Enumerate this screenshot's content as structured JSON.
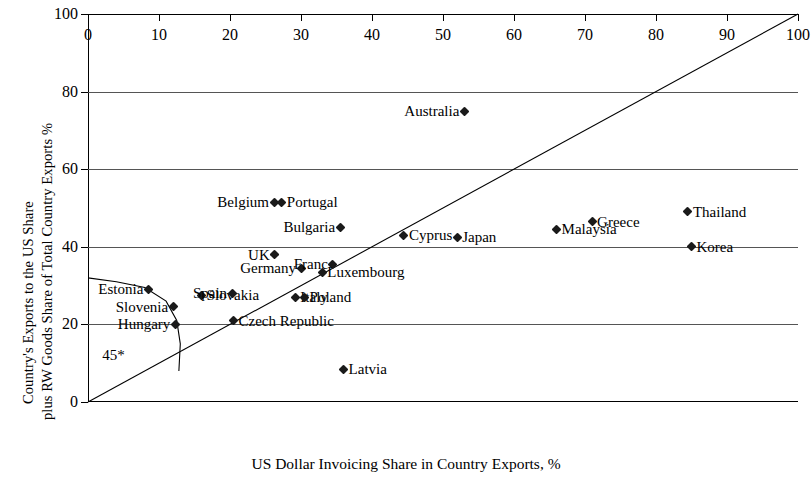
{
  "chart_data": {
    "type": "scatter",
    "title": "",
    "xlabel": "US Dollar Invoicing Share in Country Exports, %",
    "ylabel_line1": "Country's Exports to the US Share",
    "ylabel_line2": "plus RW Goods Share of Total Country Exports %",
    "xlim": [
      0,
      100
    ],
    "ylim": [
      0,
      100
    ],
    "xticks": [
      0,
      10,
      20,
      30,
      40,
      50,
      60,
      70,
      80,
      90,
      100
    ],
    "yticks": [
      0,
      20,
      40,
      60,
      80,
      100
    ],
    "grid": "horizontal",
    "legend": "none",
    "annotations": [
      {
        "text": "45*",
        "x": 2.0,
        "y": 12.0
      }
    ],
    "reference_lines": [
      {
        "name": "45-degree-line",
        "type": "linear",
        "from": [
          0,
          0
        ],
        "to": [
          100,
          100
        ]
      },
      {
        "name": "fitted-curve",
        "type": "curve",
        "points": [
          [
            0,
            32
          ],
          [
            4,
            31
          ],
          [
            8,
            29.5
          ],
          [
            11,
            26
          ],
          [
            12.5,
            21
          ],
          [
            13,
            15
          ],
          [
            12.8,
            8
          ]
        ]
      }
    ],
    "points": [
      {
        "label": "Estonia",
        "x": 8.5,
        "y": 29.0,
        "label_side": "left"
      },
      {
        "label": "Slovenia",
        "x": 12.0,
        "y": 24.5,
        "label_side": "left"
      },
      {
        "label": "Hungary",
        "x": 12.3,
        "y": 20.0,
        "label_side": "left"
      },
      {
        "label": "Slovakia",
        "x": 16.0,
        "y": 27.5,
        "label_side": "right"
      },
      {
        "label": "Spain",
        "x": 20.3,
        "y": 28.0,
        "label_side": "left"
      },
      {
        "label": "Czech Republic",
        "x": 20.5,
        "y": 21.0,
        "label_side": "right"
      },
      {
        "label": "UK",
        "x": 26.3,
        "y": 38.0,
        "label_side": "left"
      },
      {
        "label": "Belgium",
        "x": 26.2,
        "y": 51.5,
        "label_side": "left"
      },
      {
        "label": "Portugal",
        "x": 27.3,
        "y": 51.5,
        "label_side": "right"
      },
      {
        "label": "Italy",
        "x": 29.2,
        "y": 27.0,
        "label_side": "right"
      },
      {
        "label": "Germany",
        "x": 30.0,
        "y": 34.5,
        "label_side": "left"
      },
      {
        "label": "Poland",
        "x": 30.5,
        "y": 27.0,
        "label_side": "right"
      },
      {
        "label": "Franc",
        "x": 34.5,
        "y": 35.5,
        "label_side": "left"
      },
      {
        "label": "Luxembourg",
        "x": 33.0,
        "y": 33.5,
        "label_side": "right"
      },
      {
        "label": "Bulgaria",
        "x": 35.5,
        "y": 45.0,
        "label_side": "left"
      },
      {
        "label": "Latvia",
        "x": 36.0,
        "y": 8.5,
        "label_side": "right"
      },
      {
        "label": "Cyprus",
        "x": 44.5,
        "y": 43.0,
        "label_side": "right"
      },
      {
        "label": "Japan",
        "x": 52.0,
        "y": 42.5,
        "label_side": "right"
      },
      {
        "label": "Australia",
        "x": 53.0,
        "y": 75.0,
        "label_side": "left"
      },
      {
        "label": "Malaysia",
        "x": 66.0,
        "y": 44.5,
        "label_side": "right"
      },
      {
        "label": "Greece",
        "x": 71.0,
        "y": 46.5,
        "label_side": "right"
      },
      {
        "label": "Thailand",
        "x": 84.5,
        "y": 49.0,
        "label_side": "right"
      },
      {
        "label": "Korea",
        "x": 85.0,
        "y": 40.0,
        "label_side": "right"
      }
    ]
  },
  "colors": {
    "axis": "#000000",
    "grid": "#555555",
    "marker": "#1a1a1a",
    "background": "#ffffff"
  }
}
